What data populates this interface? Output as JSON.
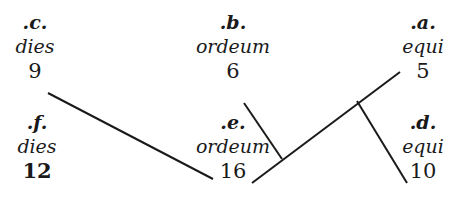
{
  "nodes": [
    {
      "id": "c",
      "label": ".c.",
      "word": "dies",
      "number": "9",
      "x": 35,
      "y": 12,
      "bold_number": false
    },
    {
      "id": "b",
      "label": ".b.",
      "word": "ordeum",
      "number": "6",
      "x": 233,
      "y": 12,
      "bold_number": false
    },
    {
      "id": "a",
      "label": ".a.",
      "word": "equi",
      "number": "5",
      "x": 418,
      "y": 12,
      "bold_number": false
    },
    {
      "id": "f",
      "label": ".f.",
      "word": "dies",
      "number": "12",
      "x": 37,
      "y": 113,
      "bold_number": true
    },
    {
      "id": "e",
      "label": ".e.",
      "word": "ordeum",
      "number": "16",
      "x": 233,
      "y": 113,
      "bold_number": false
    },
    {
      "id": "d",
      "label": ".d.",
      "word": "equi",
      "number": "10",
      "x": 418,
      "y": 113,
      "bold_number": false
    }
  ],
  "edges": [
    {
      "from": "c.9",
      "to": "e.16",
      "x1": 48,
      "y1": 93,
      "x2": 213,
      "y2": 179
    },
    {
      "from": "b.6",
      "to": "junction-1",
      "x1": 244,
      "y1": 103,
      "x2": 282,
      "y2": 159
    },
    {
      "from": "e.16",
      "to": "a.equi",
      "x1": 252,
      "y1": 183,
      "x2": 400,
      "y2": 72
    },
    {
      "from": "junction-2",
      "to": "d.10",
      "x1": 357,
      "y1": 101,
      "x2": 407,
      "y2": 183
    }
  ],
  "colors": {
    "ink": "#1a1a1a",
    "background": "#ffffff"
  }
}
